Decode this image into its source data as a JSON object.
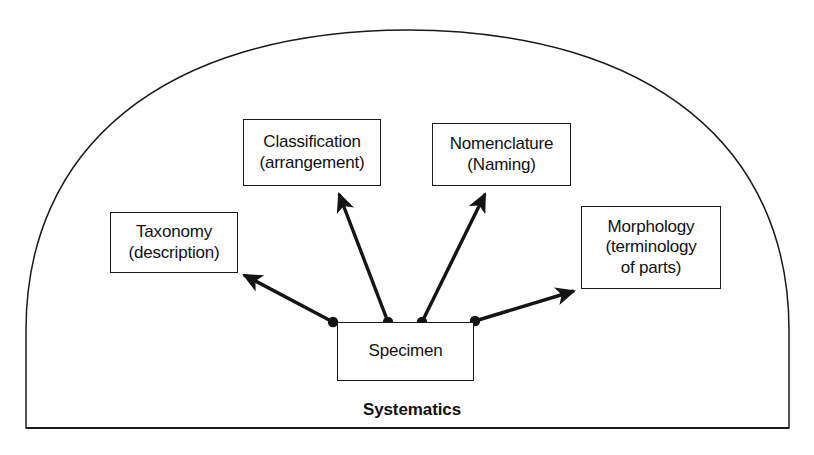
{
  "diagram": {
    "title": "Systematics",
    "container_label": "Systematics",
    "shape": "dome",
    "nodes": [
      {
        "id": "classification",
        "lines": [
          "Classification",
          "(arrangement)"
        ],
        "x": 243,
        "y": 119,
        "w": 138,
        "h": 67
      },
      {
        "id": "nomenclature",
        "lines": [
          "Nomenclature",
          "(Naming)"
        ],
        "x": 432,
        "y": 123,
        "w": 139,
        "h": 63
      },
      {
        "id": "taxonomy",
        "lines": [
          "Taxonomy",
          "(description)"
        ],
        "x": 110,
        "y": 212,
        "w": 128,
        "h": 61
      },
      {
        "id": "morphology",
        "lines": [
          "Morphology",
          "(terminology",
          "of parts)"
        ],
        "x": 581,
        "y": 206,
        "w": 140,
        "h": 83
      },
      {
        "id": "specimen",
        "lines": [
          "Specimen"
        ],
        "x": 337,
        "y": 322,
        "w": 137,
        "h": 59
      }
    ],
    "connectors": [
      {
        "id": "specimen-to-taxonomy",
        "from": "specimen",
        "to": "taxonomy",
        "from_x": 333,
        "from_y": 322,
        "to_x": 240,
        "to_y": 273
      },
      {
        "id": "specimen-to-classification",
        "from": "specimen",
        "to": "classification",
        "from_x": 388,
        "from_y": 322,
        "to_x": 336,
        "to_y": 187
      },
      {
        "id": "specimen-to-nomenclature",
        "from": "specimen",
        "to": "nomenclature",
        "from_x": 422,
        "from_y": 322,
        "to_x": 487,
        "to_y": 187
      },
      {
        "id": "specimen-to-morphology",
        "from": "specimen",
        "to": "morphology",
        "from_x": 475,
        "from_y": 321,
        "to_x": 579,
        "to_y": 289
      }
    ],
    "origin_dots": [
      {
        "id": "dot-taxonomy",
        "x": 333,
        "y": 322
      },
      {
        "id": "dot-classification",
        "x": 388,
        "y": 322
      },
      {
        "id": "dot-nomenclature",
        "x": 422,
        "y": 322
      },
      {
        "id": "dot-morphology",
        "x": 475,
        "y": 321
      }
    ],
    "dome": {
      "left": 26,
      "right": 789,
      "baseline_y": 428,
      "apex_y": 30
    },
    "colors": {
      "stroke": "#1a1a1a",
      "text": "#111111",
      "background": "#ffffff",
      "arrow": "#141414"
    }
  }
}
